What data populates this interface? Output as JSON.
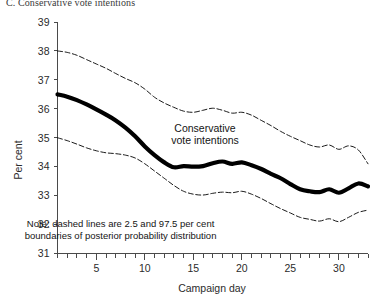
{
  "panel": {
    "title": "C. Conservative vote intentions"
  },
  "chart_data": {
    "type": "line",
    "title": "C. Conservative vote intentions",
    "xlabel": "Campaign day",
    "ylabel": "Per cent",
    "xlim": [
      1,
      33
    ],
    "ylim": [
      31,
      39
    ],
    "ytick_labels": [
      "31",
      "32",
      "33",
      "34",
      "35",
      "36",
      "37",
      "38",
      "39"
    ],
    "yticks": [
      31,
      32,
      33,
      34,
      35,
      36,
      37,
      38,
      39
    ],
    "xtick_labels": [
      "5",
      "10",
      "15",
      "20",
      "25",
      "30"
    ],
    "xticks": [
      5,
      10,
      15,
      20,
      25,
      30
    ],
    "xminor_ticks": [
      1,
      2,
      3,
      4,
      6,
      7,
      8,
      9,
      11,
      12,
      13,
      14,
      16,
      17,
      18,
      19,
      21,
      22,
      23,
      24,
      26,
      27,
      28,
      29,
      31,
      32,
      33
    ],
    "grid": false,
    "legend_position": "inline-annotation",
    "annotations": [
      {
        "name": "series-label",
        "text": "Conservative\nvote intentions",
        "x": 16.2,
        "y": 35.2
      },
      {
        "name": "note",
        "text": "Note: dashed lines are 2.5 and 97.5 per cent\nboundaries of posterior probability distribution",
        "x": 7.5,
        "y": 31.9
      }
    ],
    "x": [
      1,
      2,
      3,
      4,
      5,
      6,
      7,
      8,
      9,
      10,
      11,
      12,
      13,
      14,
      15,
      16,
      17,
      18,
      19,
      20,
      21,
      22,
      23,
      24,
      25,
      26,
      27,
      28,
      29,
      30,
      31,
      32,
      33
    ],
    "series": [
      {
        "name": "Conservative vote intentions",
        "style": "solid-thick",
        "color": "#000000",
        "values": [
          36.5,
          36.42,
          36.3,
          36.15,
          35.98,
          35.8,
          35.6,
          35.35,
          35.05,
          34.7,
          34.4,
          34.15,
          33.98,
          34.02,
          34.0,
          34.02,
          34.12,
          34.18,
          34.1,
          34.15,
          34.05,
          33.92,
          33.75,
          33.6,
          33.4,
          33.22,
          33.15,
          33.12,
          33.22,
          33.1,
          33.25,
          33.42,
          33.32
        ]
      },
      {
        "name": "97.5 per cent boundary",
        "style": "dashed",
        "color": "#000000",
        "values": [
          38.0,
          37.95,
          37.85,
          37.7,
          37.55,
          37.4,
          37.22,
          37.05,
          36.9,
          36.68,
          36.4,
          36.2,
          36.05,
          35.92,
          35.88,
          35.95,
          36.02,
          35.95,
          35.85,
          35.88,
          35.78,
          35.6,
          35.42,
          35.22,
          35.05,
          34.9,
          34.75,
          34.68,
          34.75,
          34.6,
          34.72,
          34.58,
          34.1
        ]
      },
      {
        "name": "2.5 per cent boundary",
        "style": "dashed",
        "color": "#000000",
        "values": [
          35.0,
          34.9,
          34.78,
          34.65,
          34.55,
          34.48,
          34.45,
          34.4,
          34.3,
          34.1,
          33.85,
          33.6,
          33.35,
          33.15,
          33.05,
          33.02,
          33.08,
          33.12,
          33.1,
          33.15,
          33.05,
          32.9,
          32.72,
          32.55,
          32.4,
          32.25,
          32.18,
          32.12,
          32.2,
          32.1,
          32.25,
          32.42,
          32.5
        ]
      }
    ]
  }
}
